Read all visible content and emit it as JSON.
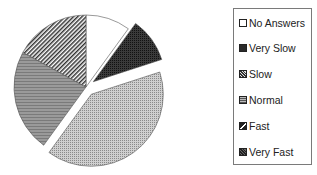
{
  "chart_data": {
    "type": "pie",
    "title": "",
    "categories": [
      "No Answers",
      "Very Slow",
      "Slow",
      "Normal",
      "Fast",
      "Very Fast"
    ],
    "values": [
      10,
      10,
      40,
      23,
      17,
      0
    ],
    "unit": "%",
    "exploded": [
      "Very Slow",
      "Slow"
    ],
    "start_angle": "12 o'clock, clockwise",
    "legend_position": "right",
    "fills": {
      "No Answers": "#ffffff",
      "Very Slow": "#2a2a2a",
      "Slow": "#b5b5b5",
      "Normal": "#8e8e8e",
      "Fast": "diagonal-stripes",
      "Very Fast": "#555555"
    }
  },
  "legend": {
    "items": [
      {
        "label": "No Answers",
        "icon": "white-square-icon"
      },
      {
        "label": "Very Slow",
        "icon": "black-square-icon"
      },
      {
        "label": "Slow",
        "icon": "dotted-square-icon"
      },
      {
        "label": "Normal",
        "icon": "lined-square-icon"
      },
      {
        "label": "Fast",
        "icon": "striped-square-icon"
      },
      {
        "label": "Very Fast",
        "icon": "dark-dotted-square-icon"
      }
    ]
  }
}
